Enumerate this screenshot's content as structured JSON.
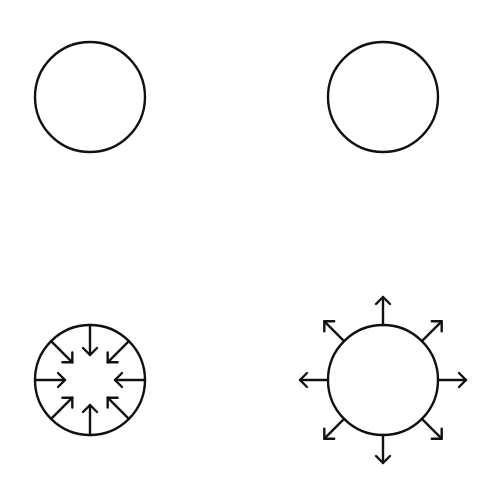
{
  "diagram": {
    "background": "#ffffff",
    "stroke_color": "#111111",
    "stroke_width": 2.4,
    "panels": [
      {
        "id": "plain-circle-top-left",
        "cx": 90,
        "cy": 97,
        "r": 55,
        "arrows": "none"
      },
      {
        "id": "plain-circle-top-right",
        "cx": 383,
        "cy": 97,
        "r": 55,
        "arrows": "none"
      },
      {
        "id": "inward-arrows-circle",
        "cx": 90,
        "cy": 380,
        "r": 55,
        "arrows": "inward",
        "arrow_count": 8,
        "arrow_inner_radius": 25
      },
      {
        "id": "outward-arrows-circle",
        "cx": 383,
        "cy": 380,
        "r": 55,
        "arrows": "outward",
        "arrow_count": 8,
        "arrow_outer_radius": 83
      }
    ]
  }
}
